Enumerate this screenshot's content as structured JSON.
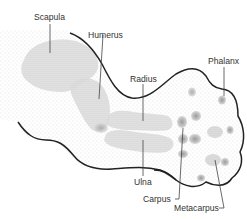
{
  "diagram": {
    "labels": {
      "scapula": "Scapula",
      "humerus": "Humerus",
      "radius": "Radius",
      "phalanx": "Phalanx",
      "ulna": "Ulna",
      "carpus": "Carpus",
      "metacarpus": "Metacarpus"
    },
    "colors": {
      "outline": "#222222",
      "bone": "#c9c9c9",
      "bone_dark": "#a8a8a8",
      "stipple": "#bdbdbd",
      "leader": "#444444",
      "text": "#333333"
    }
  }
}
